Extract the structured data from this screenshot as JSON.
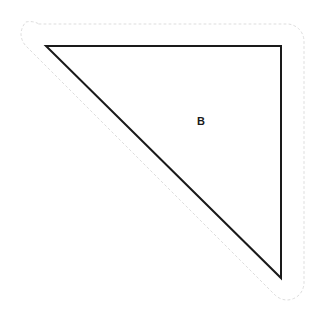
{
  "canvas": {
    "width": 320,
    "height": 319,
    "background_color": "#ffffff",
    "title": "Shape B"
  },
  "figure": {
    "name": "right-triangle-b",
    "label": "B",
    "label_position": {
      "x": 201,
      "y": 122
    },
    "stroke_color": "#1a1a1a",
    "stroke_width": 2,
    "fill_color": "none",
    "vertices": [
      {
        "name": "top-left",
        "x": 46,
        "y": 46
      },
      {
        "name": "top-right",
        "x": 281,
        "y": 46
      },
      {
        "name": "bottom-right",
        "x": 281,
        "y": 278
      }
    ],
    "path": "M 46 46 L 281 46 L 281 278 Z"
  },
  "outline": {
    "name": "offset-selection-outline",
    "stroke_color": "#dddddd",
    "stroke_width": 1,
    "dash_pattern": "2 3",
    "offset_px": 18,
    "corner_radius": 18,
    "path": "M 39 24 L 288 24 A 18 18 0 0 1 299 29 A 18 18 0 0 1 304 41 L 304 283 A 18 18 0 0 1 299 295 A 18 18 0 0 1 287 300 A 18 18 0 0 1 275 295 L 26 46 A 18 18 0 0 1 21 34 A 18 18 0 0 1 26 22 A 18 18 0 0 1 39 24 Z"
  }
}
